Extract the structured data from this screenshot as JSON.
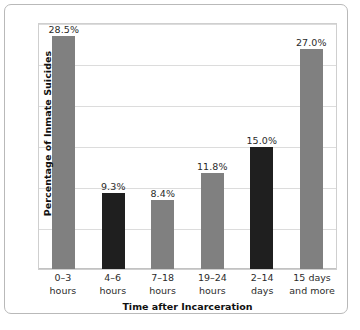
{
  "chart_data": {
    "type": "bar",
    "title": "",
    "xlabel": "Time after Incarceration",
    "ylabel": "Percentage of Inmate Suicides",
    "ylim": [
      0,
      30
    ],
    "yticks": [
      0,
      5,
      10,
      15,
      20,
      25,
      30
    ],
    "grid": true,
    "legend": "none",
    "categories": [
      "0–3 hours",
      "4–6 hours",
      "7–18 hours",
      "19–24 hours",
      "2–14 days",
      "15 days and more"
    ],
    "category_lines": [
      [
        "0–3",
        "hours"
      ],
      [
        "4–6",
        "hours"
      ],
      [
        "7–18",
        "hours"
      ],
      [
        "19–24",
        "hours"
      ],
      [
        "2–14",
        "days"
      ],
      [
        "15 days",
        "and more"
      ]
    ],
    "values": [
      28.5,
      9.3,
      8.4,
      11.8,
      15.0,
      27.0
    ],
    "value_labels": [
      "28.5%",
      "9.3%",
      "8.4%",
      "11.8%",
      "15.0%",
      "27.0%"
    ],
    "bar_colors": [
      "#808080",
      "#1f1f1f",
      "#808080",
      "#808080",
      "#1f1f1f",
      "#808080"
    ],
    "colors": {
      "bar_gray": "#808080",
      "bar_dark": "#1f1f1f",
      "gridline": "#dcdcdc",
      "frame": "#b9b9b9",
      "plot_border": "#cfcfcf",
      "text": "#2b2b2b",
      "background": "#ffffff"
    }
  }
}
